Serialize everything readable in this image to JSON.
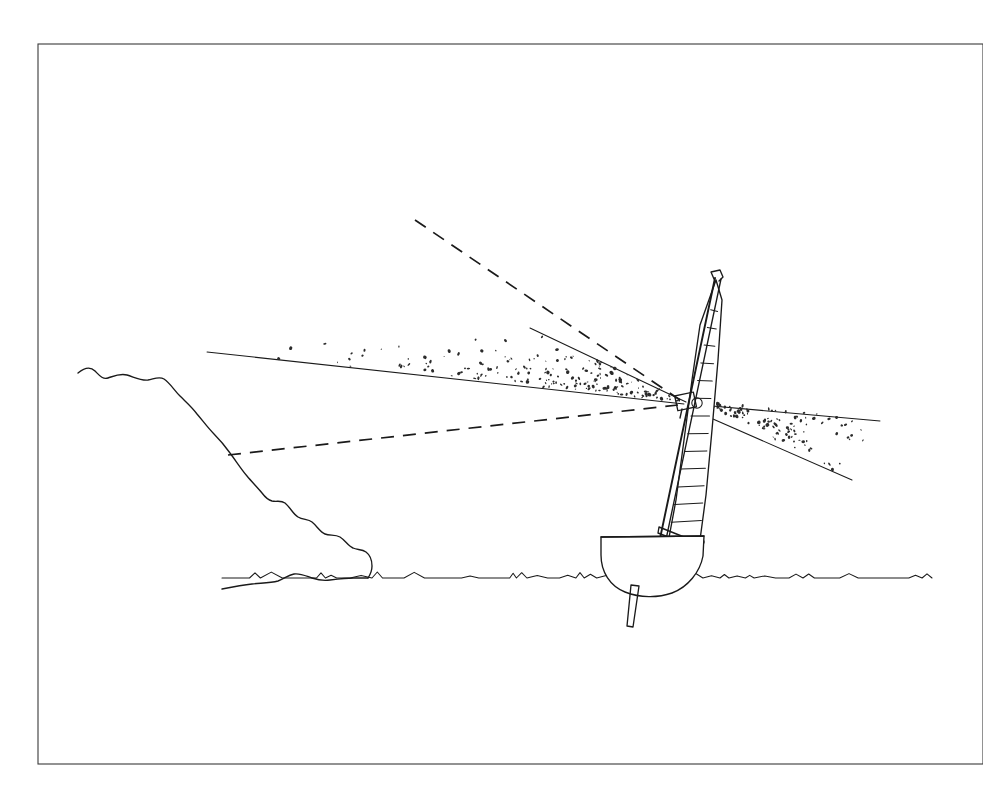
{
  "document": {
    "title": "Sailboat Masthead Wind Sensor Field Diagram",
    "medium": "technical line drawing",
    "background_color": "#ffffff",
    "ink_color": "#1a1a1a",
    "frame_color": "#3a3a3a",
    "canvas": {
      "width": 983,
      "height": 809
    }
  },
  "frame": {
    "name": "plate-border",
    "x": 38,
    "y": 44,
    "width": 945,
    "height": 720,
    "stroke_width": 1.1
  },
  "scene": {
    "waterline": {
      "label": "sea surface",
      "y": 578,
      "x_start": 222,
      "x_end": 932,
      "texture": "small irregular wave ticks"
    },
    "headland": {
      "label": "coastal cliff ridge",
      "description": "jagged descending rock ridge on the left meeting the waterline",
      "summit_x": 78,
      "summit_y": 373,
      "base_x": 368,
      "base_y": 578
    }
  },
  "boat": {
    "name": "sailing dinghy",
    "hull": {
      "label": "hull cross-section",
      "deck_port_x": 601,
      "deck_starboard_x": 704,
      "deck_y": 536,
      "keel_depth_y": 592
    },
    "centerboard": {
      "label": "centreboard",
      "top_x": 635,
      "top_y": 578,
      "tip_x": 629,
      "tip_y": 627
    },
    "mast": {
      "label": "mast",
      "heel_x": 660,
      "heel_y": 545,
      "head_x": 718,
      "head_y": 276,
      "style": "double-line tube, raked aft"
    },
    "masthead_fitting": {
      "label": "masthead crane",
      "x": 718,
      "y": 278
    },
    "boom": {
      "label": "boom",
      "inboard_x": 662,
      "inboard_y": 529,
      "outboard_x": 701,
      "outboard_y": 547
    },
    "sail": {
      "label": "mainsail",
      "luff": "along mast",
      "leech_top_x": 722,
      "leech_bottom_x": 700,
      "foot_y": 543,
      "batten_count": 13
    }
  },
  "sensor": {
    "label": "masthead wind sensor unit",
    "name": "mast-mounted instrument",
    "x": 688,
    "y": 402,
    "note": "apex where all measurement cones converge"
  },
  "cones": [
    {
      "id": "upper-left-stippled-cone",
      "label": "forward stippled detection cone",
      "fill": "stipple",
      "apex_x": 686,
      "apex_y": 402,
      "edge_upper_x": 530,
      "edge_upper_y": 328,
      "edge_lower_x": 207,
      "edge_lower_y": 352,
      "boundary_style": "solid"
    },
    {
      "id": "right-stippled-cone",
      "label": "aft stippled detection cone",
      "fill": "stipple",
      "apex_x": 700,
      "apex_y": 400,
      "edge_upper_x": 880,
      "edge_upper_y": 421,
      "edge_lower_x": 852,
      "edge_lower_y": 480,
      "boundary_style": "solid"
    }
  ],
  "rays": [
    {
      "id": "upper-dashed-ray",
      "label": "upper dashed reference axis",
      "style": "dashed",
      "from_x": 415,
      "from_y": 220,
      "to_x": 680,
      "to_y": 400
    },
    {
      "id": "lower-dashed-ray",
      "label": "lower dashed reference axis",
      "style": "dashed",
      "from_x": 228,
      "from_y": 455,
      "to_x": 678,
      "to_y": 405
    }
  ],
  "stipple": {
    "upper_cone_dot_count": 190,
    "right_cone_dot_count": 110,
    "dot_color": "#2b2b2b",
    "dot_size_range": [
      0.7,
      2.0
    ]
  }
}
